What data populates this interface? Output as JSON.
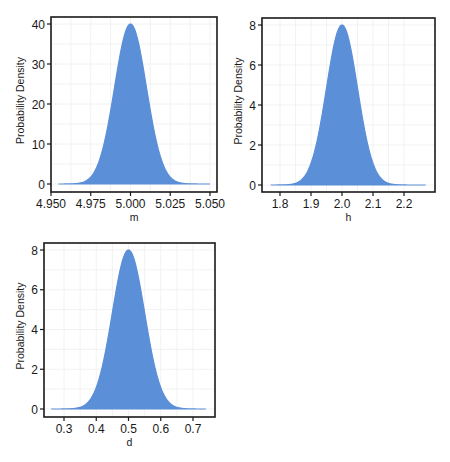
{
  "colors": {
    "fill": "#5b8fd8",
    "frame": "#1a1a1a",
    "grid": "#efefef",
    "background": "#ffffff"
  },
  "chart_data": [
    {
      "type": "area",
      "title": "",
      "xlabel": "m",
      "ylabel": "Probability Density",
      "xlim": [
        4.95,
        5.05
      ],
      "ylim": [
        0,
        40
      ],
      "xticks": [
        "4.950",
        "4.975",
        "5.000",
        "5.025",
        "5.050"
      ],
      "xtick_values": [
        4.95,
        4.975,
        5.0,
        5.025,
        5.05
      ],
      "yticks": [
        "0",
        "10",
        "20",
        "30",
        "40"
      ],
      "ytick_values": [
        0,
        10,
        20,
        30,
        40
      ],
      "distribution": "normal",
      "mean": 5.0,
      "sd": 0.01,
      "peak": 40,
      "x_range": [
        4.955,
        5.05
      ],
      "grid": true,
      "legend": null
    },
    {
      "type": "area",
      "title": "",
      "xlabel": "h",
      "ylabel": "Probability Density",
      "xlim": [
        1.74,
        2.28
      ],
      "ylim": [
        0,
        8
      ],
      "xticks": [
        "1.8",
        "1.9",
        "2.0",
        "2.1",
        "2.2"
      ],
      "xtick_values": [
        1.8,
        1.9,
        2.0,
        2.1,
        2.2
      ],
      "yticks": [
        "0",
        "2",
        "4",
        "6",
        "8"
      ],
      "ytick_values": [
        0,
        2,
        4,
        6,
        8
      ],
      "distribution": "normal",
      "mean": 2.0,
      "sd": 0.05,
      "peak": 8,
      "x_range": [
        1.77,
        2.27
      ],
      "grid": true,
      "legend": null
    },
    {
      "type": "area",
      "title": "",
      "xlabel": "d",
      "ylabel": "Probability Density",
      "xlim": [
        0.24,
        0.76
      ],
      "ylim": [
        0,
        8
      ],
      "xticks": [
        "0.3",
        "0.4",
        "0.5",
        "0.6",
        "0.7"
      ],
      "xtick_values": [
        0.3,
        0.4,
        0.5,
        0.6,
        0.7
      ],
      "yticks": [
        "0",
        "2",
        "4",
        "6",
        "8"
      ],
      "ytick_values": [
        0,
        2,
        4,
        6,
        8
      ],
      "distribution": "normal",
      "mean": 0.5,
      "sd": 0.05,
      "peak": 8,
      "x_range": [
        0.26,
        0.74
      ],
      "grid": true,
      "legend": null
    }
  ]
}
